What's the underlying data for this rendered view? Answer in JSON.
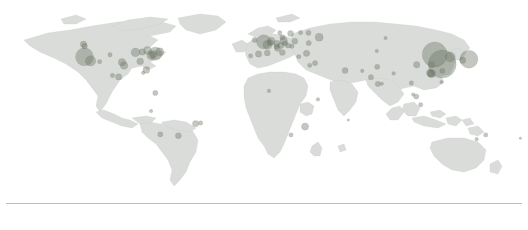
{
  "figure": {
    "title": "",
    "subtitle": "",
    "background_color": "#ffffff",
    "land_color": "#d9dcd9",
    "land_stroke_color": "#c3c7c3",
    "bubble_color": "#6f7a68",
    "bubble_opacity": 0.42,
    "rule_color": "#b9bdc2"
  },
  "axes": {
    "xlabel": "",
    "ylabel": "",
    "xticks": [],
    "yticks": [],
    "grid": false
  },
  "legend": {
    "visible": false,
    "position": "none",
    "entries": []
  },
  "annotations": [],
  "footer": {
    "rule_visible": true,
    "text": ""
  },
  "chart_data": {
    "type": "scatter",
    "title": "",
    "subtitle": "",
    "xlabel": "longitude",
    "ylabel": "latitude",
    "xlim": [
      -180,
      180
    ],
    "ylim": [
      -90,
      90
    ],
    "grid": false,
    "projection": "equirectangular",
    "marker": "circle",
    "marker_color": "#6f7a68",
    "marker_opacity": 0.42,
    "size_encoding": "bubble radius proportional to value",
    "legend_position": "none",
    "points": [
      {
        "label": "Vancouver",
        "x": -123.1,
        "y": 49.3,
        "value": 5,
        "r": 3.2
      },
      {
        "label": "Seattle",
        "x": -122.3,
        "y": 47.6,
        "value": 4,
        "r": 2.8
      },
      {
        "label": "San Francisco",
        "x": -122.4,
        "y": 37.8,
        "value": 42,
        "r": 9.0
      },
      {
        "label": "Los Angeles",
        "x": -118.2,
        "y": 34.1,
        "value": 14,
        "r": 5.2
      },
      {
        "label": "Phoenix",
        "x": -112.1,
        "y": 33.4,
        "value": 3,
        "r": 2.2
      },
      {
        "label": "Denver",
        "x": -105.0,
        "y": 39.7,
        "value": 3,
        "r": 2.2
      },
      {
        "label": "Dallas",
        "x": -96.8,
        "y": 32.8,
        "value": 8,
        "r": 3.8
      },
      {
        "label": "Houston",
        "x": -95.4,
        "y": 29.8,
        "value": 8,
        "r": 3.8
      },
      {
        "label": "Chicago",
        "x": -87.6,
        "y": 41.9,
        "value": 11,
        "r": 4.4
      },
      {
        "label": "Atlanta",
        "x": -84.4,
        "y": 33.7,
        "value": 7,
        "r": 3.4
      },
      {
        "label": "Detroit",
        "x": -83.0,
        "y": 42.3,
        "value": 6,
        "r": 3.2
      },
      {
        "label": "Toronto",
        "x": -79.4,
        "y": 43.7,
        "value": 9,
        "r": 4.0
      },
      {
        "label": "Miami",
        "x": -80.2,
        "y": 25.8,
        "value": 7,
        "r": 3.4
      },
      {
        "label": "Washington DC",
        "x": -77.0,
        "y": 38.9,
        "value": 10,
        "r": 4.2
      },
      {
        "label": "Philadelphia",
        "x": -75.2,
        "y": 39.9,
        "value": 7,
        "r": 3.4
      },
      {
        "label": "New York",
        "x": -74.0,
        "y": 40.7,
        "value": 22,
        "r": 6.6
      },
      {
        "label": "Boston",
        "x": -71.1,
        "y": 42.4,
        "value": 9,
        "r": 4.0
      },
      {
        "label": "Mexico City",
        "x": -99.1,
        "y": 19.4,
        "value": 6,
        "r": 3.2
      },
      {
        "label": "Guadalajara",
        "x": -103.3,
        "y": 20.7,
        "value": 3,
        "r": 2.2
      },
      {
        "label": "Havana",
        "x": -82.4,
        "y": 23.1,
        "value": 2,
        "r": 1.8
      },
      {
        "label": "Bogota",
        "x": -74.1,
        "y": 4.7,
        "value": 4,
        "r": 2.6
      },
      {
        "label": "Lima",
        "x": -77.0,
        "y": -12.0,
        "value": 2,
        "r": 1.8
      },
      {
        "label": "Sao Paulo",
        "x": -46.6,
        "y": -23.5,
        "value": 6,
        "r": 3.2
      },
      {
        "label": "Rio de Janeiro",
        "x": -43.2,
        "y": -22.9,
        "value": 3,
        "r": 2.2
      },
      {
        "label": "Buenos Aires",
        "x": -58.4,
        "y": -34.6,
        "value": 5,
        "r": 3.0
      },
      {
        "label": "Santiago",
        "x": -70.7,
        "y": -33.4,
        "value": 4,
        "r": 2.6
      },
      {
        "label": "Dublin",
        "x": -6.3,
        "y": 53.3,
        "value": 4,
        "r": 2.6
      },
      {
        "label": "London",
        "x": -0.1,
        "y": 51.5,
        "value": 26,
        "r": 7.2
      },
      {
        "label": "Paris",
        "x": 2.4,
        "y": 48.9,
        "value": 12,
        "r": 4.6
      },
      {
        "label": "Brussels",
        "x": 4.4,
        "y": 50.8,
        "value": 5,
        "r": 3.0
      },
      {
        "label": "Amsterdam",
        "x": 4.9,
        "y": 52.4,
        "value": 8,
        "r": 3.8
      },
      {
        "label": "Madrid",
        "x": -3.7,
        "y": 40.4,
        "value": 6,
        "r": 3.2
      },
      {
        "label": "Barcelona",
        "x": 2.2,
        "y": 41.4,
        "value": 5,
        "r": 3.0
      },
      {
        "label": "Lisbon",
        "x": -9.1,
        "y": 38.7,
        "value": 3,
        "r": 2.2
      },
      {
        "label": "Milan",
        "x": 9.2,
        "y": 45.5,
        "value": 5,
        "r": 3.0
      },
      {
        "label": "Rome",
        "x": 12.5,
        "y": 41.9,
        "value": 5,
        "r": 3.0
      },
      {
        "label": "Zurich",
        "x": 8.5,
        "y": 47.4,
        "value": 4,
        "r": 2.6
      },
      {
        "label": "Frankfurt",
        "x": 8.7,
        "y": 50.1,
        "value": 6,
        "r": 3.2
      },
      {
        "label": "Berlin",
        "x": 13.4,
        "y": 52.5,
        "value": 8,
        "r": 3.8
      },
      {
        "label": "Munich",
        "x": 11.6,
        "y": 48.1,
        "value": 5,
        "r": 3.0
      },
      {
        "label": "Copenhagen",
        "x": 12.6,
        "y": 55.7,
        "value": 4,
        "r": 2.6
      },
      {
        "label": "Stockholm",
        "x": 18.1,
        "y": 59.3,
        "value": 5,
        "r": 3.0
      },
      {
        "label": "Oslo",
        "x": 10.8,
        "y": 59.9,
        "value": 3,
        "r": 2.2
      },
      {
        "label": "Helsinki",
        "x": 24.9,
        "y": 60.2,
        "value": 3,
        "r": 2.2
      },
      {
        "label": "Warsaw",
        "x": 21.0,
        "y": 52.2,
        "value": 5,
        "r": 3.0
      },
      {
        "label": "Prague",
        "x": 14.4,
        "y": 50.1,
        "value": 4,
        "r": 2.6
      },
      {
        "label": "Vienna",
        "x": 16.4,
        "y": 48.2,
        "value": 4,
        "r": 2.6
      },
      {
        "label": "Budapest",
        "x": 19.0,
        "y": 47.5,
        "value": 3,
        "r": 2.2
      },
      {
        "label": "Athens",
        "x": 23.7,
        "y": 38.0,
        "value": 3,
        "r": 2.2
      },
      {
        "label": "Istanbul",
        "x": 29.0,
        "y": 41.0,
        "value": 6,
        "r": 3.2
      },
      {
        "label": "Kyiv",
        "x": 30.5,
        "y": 50.5,
        "value": 4,
        "r": 2.6
      },
      {
        "label": "Moscow",
        "x": 37.6,
        "y": 55.8,
        "value": 9,
        "r": 4.0
      },
      {
        "label": "Saint Petersburg",
        "x": 30.3,
        "y": 59.9,
        "value": 4,
        "r": 2.6
      },
      {
        "label": "Tel Aviv",
        "x": 34.8,
        "y": 32.1,
        "value": 4,
        "r": 2.6
      },
      {
        "label": "Cairo",
        "x": 31.2,
        "y": 30.0,
        "value": 3,
        "r": 2.2
      },
      {
        "label": "Dubai",
        "x": 55.3,
        "y": 25.2,
        "value": 5,
        "r": 3.0
      },
      {
        "label": "Lagos",
        "x": 3.4,
        "y": 6.5,
        "value": 2,
        "r": 1.8
      },
      {
        "label": "Nairobi",
        "x": 36.8,
        "y": -1.3,
        "value": 2,
        "r": 1.8
      },
      {
        "label": "Johannesburg",
        "x": 28.0,
        "y": -26.2,
        "value": 7,
        "r": 3.6
      },
      {
        "label": "Cape Town",
        "x": 18.4,
        "y": -33.9,
        "value": 3,
        "r": 2.2
      },
      {
        "label": "Mauritius",
        "x": 57.5,
        "y": -20.2,
        "value": 1,
        "r": 1.2
      },
      {
        "label": "Karachi",
        "x": 67.0,
        "y": 24.9,
        "value": 2,
        "r": 1.8
      },
      {
        "label": "Delhi",
        "x": 77.2,
        "y": 28.6,
        "value": 4,
        "r": 2.6
      },
      {
        "label": "Mumbai",
        "x": 72.9,
        "y": 19.1,
        "value": 4,
        "r": 2.6
      },
      {
        "label": "Bengaluru",
        "x": 77.6,
        "y": 12.9,
        "value": 4,
        "r": 2.6
      },
      {
        "label": "Chennai",
        "x": 80.3,
        "y": 13.1,
        "value": 2,
        "r": 1.8
      },
      {
        "label": "Kolkata",
        "x": 88.4,
        "y": 22.6,
        "value": 2,
        "r": 1.8
      },
      {
        "label": "Almaty",
        "x": 76.9,
        "y": 43.2,
        "value": 2,
        "r": 1.8
      },
      {
        "label": "Novosibirsk",
        "x": 82.9,
        "y": 55.0,
        "value": 2,
        "r": 1.8
      },
      {
        "label": "Bangkok",
        "x": 100.5,
        "y": 13.8,
        "value": 3,
        "r": 2.2
      },
      {
        "label": "Singapore",
        "x": 103.8,
        "y": 1.4,
        "value": 4,
        "r": 2.6
      },
      {
        "label": "Jakarta",
        "x": 106.8,
        "y": -6.2,
        "value": 3,
        "r": 2.2
      },
      {
        "label": "Kuala Lumpur",
        "x": 101.7,
        "y": 3.1,
        "value": 2,
        "r": 1.8
      },
      {
        "label": "Manila",
        "x": 121.0,
        "y": 14.6,
        "value": 2,
        "r": 1.8
      },
      {
        "label": "Chengdu",
        "x": 104.1,
        "y": 30.6,
        "value": 6,
        "r": 3.2
      },
      {
        "label": "Guangzhou",
        "x": 113.3,
        "y": 23.1,
        "value": 8,
        "r": 3.8
      },
      {
        "label": "Hong Kong",
        "x": 114.2,
        "y": 22.3,
        "value": 9,
        "r": 4.0
      },
      {
        "label": "Shenzhen",
        "x": 114.1,
        "y": 22.5,
        "value": 7,
        "r": 3.6
      },
      {
        "label": "Shanghai",
        "x": 121.5,
        "y": 31.2,
        "value": 40,
        "r": 14.0
      },
      {
        "label": "Beijing",
        "x": 116.4,
        "y": 39.9,
        "value": 34,
        "r": 12.5
      },
      {
        "label": "Wuhan",
        "x": 114.3,
        "y": 30.6,
        "value": 6,
        "r": 3.2
      },
      {
        "label": "Seoul",
        "x": 127.0,
        "y": 37.6,
        "value": 12,
        "r": 5.0
      },
      {
        "label": "Tokyo",
        "x": 139.7,
        "y": 35.7,
        "value": 24,
        "r": 9.0
      },
      {
        "label": "Osaka",
        "x": 135.5,
        "y": 34.7,
        "value": 6,
        "r": 3.2
      },
      {
        "label": "Taipei",
        "x": 121.6,
        "y": 25.0,
        "value": 4,
        "r": 2.6
      },
      {
        "label": "Sydney",
        "x": 151.2,
        "y": -33.9,
        "value": 3,
        "r": 2.2
      },
      {
        "label": "Melbourne",
        "x": 145.0,
        "y": -37.8,
        "value": 2,
        "r": 1.8
      },
      {
        "label": "Auckland",
        "x": 174.8,
        "y": -36.9,
        "value": 1,
        "r": 1.2
      }
    ]
  }
}
